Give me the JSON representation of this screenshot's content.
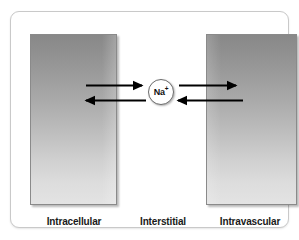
{
  "figure": {
    "frame": {
      "border_color": "#c9c9c9",
      "background": "#ffffff"
    }
  },
  "compartments": [
    {
      "id": "intracellular",
      "label": "Intracellular",
      "kind": "gradient-box",
      "gradient_top": "#888888",
      "gradient_bottom": "#e3e3e3",
      "border_color": "#8a8a8a"
    },
    {
      "id": "interstitial",
      "label": "Interstitial",
      "kind": "gap-space",
      "background": "#ffffff"
    },
    {
      "id": "intravascular",
      "label": "Intravascular",
      "kind": "gradient-box",
      "gradient_top": "#888888",
      "gradient_bottom": "#e3e3e3",
      "border_color": "#8a8a8a"
    }
  ],
  "ion": {
    "symbol": "Na",
    "charge": "+",
    "text": "Na+",
    "shape": "circle",
    "fill": "#ffffff",
    "stroke": "#6d6d6d"
  },
  "arrows": [
    {
      "id": "intracellular-to-interstitial",
      "from": "intracellular",
      "to": "interstitial",
      "direction": "right",
      "row": "top",
      "color": "#000000"
    },
    {
      "id": "interstitial-to-intracellular",
      "from": "interstitial",
      "to": "intracellular",
      "direction": "left",
      "row": "bottom",
      "color": "#000000"
    },
    {
      "id": "interstitial-to-intravascular",
      "from": "interstitial",
      "to": "intravascular",
      "direction": "right",
      "row": "top",
      "color": "#000000"
    },
    {
      "id": "intravascular-to-interstitial",
      "from": "intravascular",
      "to": "interstitial",
      "direction": "left",
      "row": "bottom",
      "color": "#000000"
    }
  ]
}
